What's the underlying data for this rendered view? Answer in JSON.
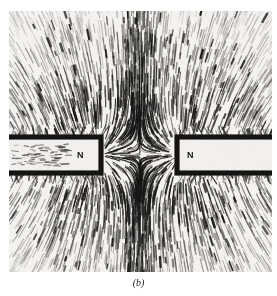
{
  "figure": {
    "caption": "(b)",
    "kind": "photograph"
  },
  "photo": {
    "background_color": "#f4f3f1",
    "filing_color": "#111111",
    "frame": {
      "x": 9,
      "y": 11,
      "width": 263,
      "height": 261
    }
  },
  "magnets": [
    {
      "id": "left-magnet",
      "pole_label": "N",
      "orientation": "horizontal",
      "rect": {
        "x": -22,
        "y": 126,
        "width": 114,
        "height": 36
      },
      "label_position": {
        "x": 68,
        "y": 140
      },
      "face": "right"
    },
    {
      "id": "right-magnet",
      "pole_label": "N",
      "orientation": "horizontal",
      "rect": {
        "x": 168,
        "y": 126,
        "width": 118,
        "height": 36
      },
      "label_position": {
        "x": 178,
        "y": 140
      },
      "face": "left"
    }
  ],
  "field": {
    "neutral_point": {
      "x": 131,
      "y": 144
    },
    "description": "like poles repel; filings splay vertically away from the midline gap",
    "pole_centers": [
      {
        "x": 92,
        "y": 144
      },
      {
        "x": 170,
        "y": 144
      }
    ],
    "streak_count": 2100
  },
  "colors": {
    "page": "#ffffff",
    "ink": "#111111",
    "photo_paper": "#f4f3f1",
    "caption": "#1a1a1a"
  }
}
